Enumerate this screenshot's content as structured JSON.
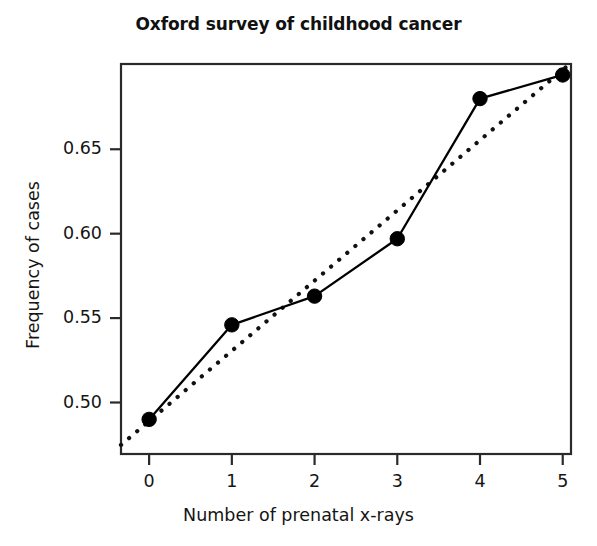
{
  "chart_data": {
    "type": "line",
    "title": "Oxford survey of childhood cancer",
    "xlabel": "Number of prenatal x-rays",
    "ylabel": "Frequency of cases",
    "x": [
      0,
      1,
      2,
      3,
      4,
      5
    ],
    "categories": [
      "0",
      "1",
      "2",
      "3",
      "4",
      "5"
    ],
    "series": [
      {
        "name": "observed",
        "style": "solid-with-markers",
        "values": [
          0.49,
          0.546,
          0.563,
          0.597,
          0.68,
          0.694
        ]
      },
      {
        "name": "fitted-trend",
        "style": "dotted",
        "values": [
          0.489,
          0.531,
          0.572,
          0.614,
          0.655,
          0.697
        ]
      }
    ],
    "xlim": [
      -0.34,
      5.1
    ],
    "ylim": [
      0.4695,
      0.7005
    ],
    "xticks": [
      0,
      1,
      2,
      3,
      4,
      5
    ],
    "xticklabels": [
      "0",
      "1",
      "2",
      "3",
      "4",
      "5"
    ],
    "yticks": [
      0.5,
      0.55,
      0.6,
      0.65
    ],
    "yticklabels": [
      "0.50",
      "0.55",
      "0.60",
      "0.65"
    ],
    "grid": false,
    "legend": null,
    "frame": true,
    "marker": "filled-circle",
    "line_color": "#000000",
    "marker_color": "#000000",
    "background_color": "#ffffff"
  }
}
